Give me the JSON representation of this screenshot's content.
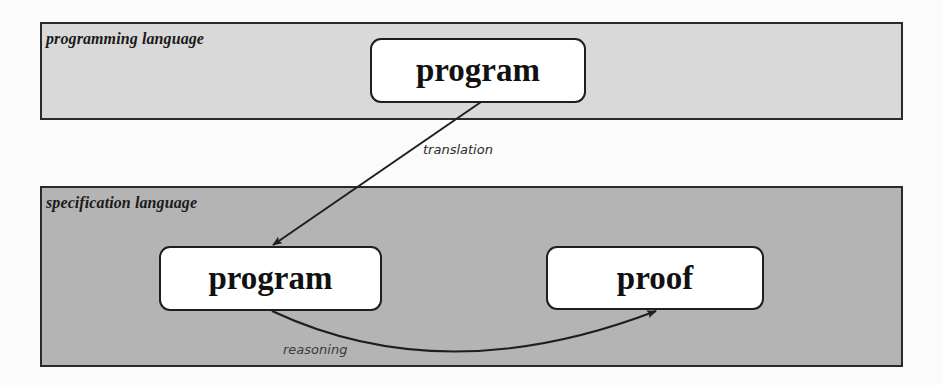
{
  "bands": {
    "top": {
      "label": "programming language",
      "fill": "#d9d9d9"
    },
    "bottom": {
      "label": "specification language",
      "fill": "#b4b4b4"
    }
  },
  "nodes": {
    "program_top": {
      "label": "program"
    },
    "program_bottom": {
      "label": "program"
    },
    "proof": {
      "label": "proof"
    }
  },
  "edges": {
    "translation": {
      "label": "translation",
      "from": "program_top",
      "to": "program_bottom"
    },
    "reasoning": {
      "label": "reasoning",
      "from": "program_bottom",
      "to": "proof"
    }
  },
  "colors": {
    "background": "#fbfbfb",
    "stroke": "#1e1e1e",
    "node_fill": "#ffffff"
  }
}
